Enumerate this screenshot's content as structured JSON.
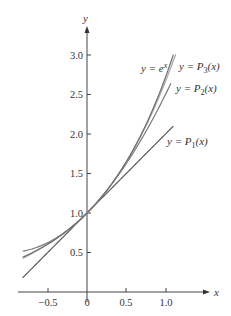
{
  "chart_data": {
    "type": "line",
    "title": "",
    "xlabel": "x",
    "ylabel": "y",
    "xlim": [
      -0.82,
      1.55
    ],
    "ylim": [
      0,
      3.3
    ],
    "grid": false,
    "x_ticks": [
      -0.5,
      0,
      0.5,
      1.0
    ],
    "x_tick_labels": [
      "−0.5",
      "0",
      "0.5",
      "1.0"
    ],
    "y_ticks": [
      0.5,
      1.0,
      1.5,
      2.0,
      2.5,
      3.0
    ],
    "y_tick_labels": [
      "0.5",
      "1.0",
      "1.5",
      "2.0",
      "2.5",
      "3.0"
    ],
    "series": [
      {
        "name": "y = e^x",
        "label_main": "y = e",
        "label_sup": "x",
        "label_sub": "",
        "label_tail": "",
        "formula": "exp(x)",
        "x_range": [
          -0.82,
          1.1
        ],
        "color": "#6e6e6e"
      },
      {
        "name": "y = P3(x)",
        "label_main": "y = ",
        "label_fn": "P",
        "label_sub": "3",
        "label_tail": "(x)",
        "formula": "1 + x + x^2/2 + x^3/6",
        "x_range": [
          -0.82,
          1.1
        ],
        "color": "#9a9a9a"
      },
      {
        "name": "y = P2(x)",
        "label_main": "y = ",
        "label_fn": "P",
        "label_sub": "2",
        "label_tail": "(x)",
        "formula": "1 + x + x^2/2",
        "x_range": [
          -0.82,
          1.1
        ],
        "color": "#7a7a7a"
      },
      {
        "name": "y = P1(x)",
        "label_main": "y = ",
        "label_fn": "P",
        "label_sub": "1",
        "label_tail": "(x)",
        "formula": "1 + x",
        "x_range": [
          -0.82,
          1.1
        ],
        "color": "#5a5a5a"
      }
    ],
    "annotations": [
      "y = e^x",
      "y = P3(x)",
      "y = P2(x)",
      "y = P1(x)"
    ],
    "legend_position": "inline-labels-at-curve-ends"
  }
}
